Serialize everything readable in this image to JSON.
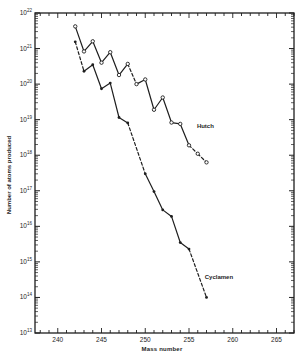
{
  "chart_data": {
    "type": "line",
    "title": "",
    "xlabel": "Mass number",
    "ylabel": "Number of atoms produced",
    "xscale": "linear",
    "yscale": "log",
    "xlim": [
      237.4,
      267
    ],
    "ylim": [
      10000000000000.0,
      1e+22
    ],
    "grid": false,
    "legend": "none (series labeled inline)",
    "xticks": [
      240,
      245,
      250,
      255,
      260,
      265
    ],
    "xtick_labels": [
      "240",
      "245",
      "250",
      "255",
      "260",
      "265"
    ],
    "yticks_exponents": [
      13,
      14,
      15,
      16,
      17,
      18,
      19,
      20,
      21,
      22
    ],
    "ytick_base": "10",
    "series": [
      {
        "name": "Hutch",
        "marker": "open-circle",
        "x": [
          242,
          243,
          244,
          245,
          246,
          247,
          248,
          249,
          250,
          251,
          252,
          253,
          254,
          255,
          256,
          257
        ],
        "values": [
          4.2e+21,
          8.3e+20,
          1.6e+21,
          4e+20,
          7.9e+20,
          1.8e+20,
          3.7e+20,
          1e+20,
          1.35e+20,
          1.9e+19,
          4.2e+19,
          8.3e+18,
          7.6e+18,
          1.9e+18,
          1.1e+18,
          6.3e+17
        ],
        "segment_styles": [
          "solid",
          "solid",
          "solid",
          "solid",
          "solid",
          "solid",
          "dashed",
          "solid",
          "solid",
          "solid",
          "solid",
          "solid",
          "solid",
          "dashed",
          "dashed"
        ]
      },
      {
        "name": "Cyclamen",
        "marker": "filled-dot",
        "x": [
          242,
          243,
          244,
          245,
          246,
          247,
          248,
          250,
          251,
          252,
          253,
          254,
          255,
          257
        ],
        "values": [
          1.55e+21,
          2.3e+20,
          3.5e+20,
          7.4e+19,
          1.07e+20,
          1.15e+19,
          8.1e+18,
          3e+17,
          9.5e+16,
          2.9e+16,
          1.9e+16,
          3500000000000000.0,
          2300000000000000.0,
          100000000000000.0
        ],
        "segment_styles": [
          "dashed",
          "solid",
          "solid",
          "solid",
          "solid",
          "solid",
          "dashed",
          "solid",
          "solid",
          "solid",
          "solid",
          "solid",
          "dashed"
        ]
      }
    ],
    "annotations": [
      {
        "text": "Hutch",
        "x": 255.9,
        "y": 6.6e+18
      },
      {
        "text": "Cyclamen",
        "x": 256.8,
        "y": 380000000000000.0
      }
    ]
  },
  "colors": {
    "ink": "#1e1e1e",
    "background": "#ffffff"
  }
}
